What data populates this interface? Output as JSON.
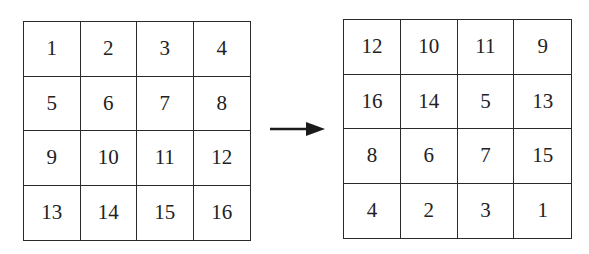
{
  "left_grid": {
    "rows": [
      [
        "1",
        "2",
        "3",
        "4"
      ],
      [
        "5",
        "6",
        "7",
        "8"
      ],
      [
        "9",
        "10",
        "11",
        "12"
      ],
      [
        "13",
        "14",
        "15",
        "16"
      ]
    ]
  },
  "arrow": {
    "direction": "right",
    "color": "#1a1a1a"
  },
  "right_grid": {
    "rows": [
      [
        "12",
        "10",
        "11",
        "9"
      ],
      [
        "16",
        "14",
        "5",
        "13"
      ],
      [
        "8",
        "6",
        "7",
        "15"
      ],
      [
        "4",
        "2",
        "3",
        "1"
      ]
    ]
  }
}
